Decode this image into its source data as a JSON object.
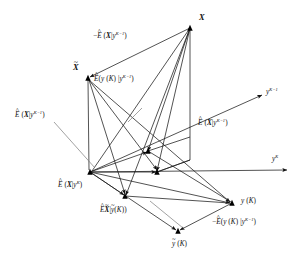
{
  "figure": {
    "kind": "vector-space-geometry-diagram",
    "background_color": "#ffffff",
    "line_color": "#1a1a1a",
    "node_color": "#000000",
    "guide_color": "#7a7a7a",
    "width": 300,
    "height": 262
  },
  "axes": [
    {
      "id": "y-K-minus-1",
      "name": "y-superscript-K-minus-1-axis",
      "label_main": "y",
      "label_sup": "K−1",
      "from": [
        90,
        172
      ],
      "to": [
        262,
        95
      ],
      "label_pos": [
        266,
        89
      ]
    },
    {
      "id": "y-K",
      "name": "y-superscript-K-axis",
      "label_main": "y",
      "label_sup": "K",
      "from": [
        90,
        172
      ],
      "to": [
        287,
        170
      ],
      "label_pos": [
        272,
        156
      ]
    }
  ],
  "nodes": [
    {
      "id": "X",
      "name": "node-X",
      "pos": [
        190,
        28
      ],
      "marker": "filled-triangle"
    },
    {
      "id": "Xtilde",
      "name": "node-X-tilde",
      "pos": [
        88,
        78
      ],
      "marker": "filled-triangle"
    },
    {
      "id": "origin",
      "name": "node-origin-Ehat-X-given-yK",
      "pos": [
        90,
        172
      ],
      "marker": "filled-triangle"
    },
    {
      "id": "mid",
      "name": "node-mid-projection",
      "pos": [
        157,
        172
      ],
      "marker": "filled-triangle"
    },
    {
      "id": "yK",
      "name": "node-y-K",
      "pos": [
        232,
        203
      ],
      "marker": "filled-triangle"
    },
    {
      "id": "ytilde",
      "name": "node-y-tilde-K",
      "pos": [
        178,
        231
      ],
      "marker": "filled-triangle"
    },
    {
      "id": "low",
      "name": "node-Ehat-Xtilde-given-ytilde",
      "pos": [
        125,
        196
      ],
      "marker": "filled-triangle"
    },
    {
      "id": "upmid",
      "name": "node-upper-mid",
      "pos": [
        148,
        151
      ],
      "marker": "filled-triangle"
    }
  ],
  "labels": [
    {
      "id": "X",
      "name": "label-X",
      "pos": [
        199,
        14
      ],
      "size": "big",
      "parts": [
        {
          "t": "X",
          "style": "bi"
        }
      ]
    },
    {
      "id": "Xtilde",
      "name": "label-X-tilde",
      "pos": [
        73,
        64
      ],
      "size": "big",
      "parts": [
        {
          "t": "X",
          "style": "bi",
          "over": "tilde"
        }
      ]
    },
    {
      "id": "negEhatX",
      "name": "label-minus-Ehat-X-given-y-K-minus-1",
      "pos": [
        93,
        33
      ],
      "size": "normal",
      "parts": [
        {
          "t": "−",
          "style": "plain"
        },
        {
          "t": "E",
          "style": "it",
          "over": "hat"
        },
        {
          "t": " (",
          "style": "plain"
        },
        {
          "t": "X",
          "style": "bi"
        },
        {
          "t": "|",
          "style": "plain"
        },
        {
          "t": "y",
          "style": "it",
          "sup": "K−1"
        },
        {
          "t": ")",
          "style": "plain"
        }
      ]
    },
    {
      "id": "EhatyK",
      "name": "label-Ehat-y-K-given-y-K-minus-1",
      "pos": [
        94,
        76
      ],
      "size": "normal",
      "parts": [
        {
          "t": "E",
          "style": "it",
          "over": "hat"
        },
        {
          "t": "(",
          "style": "plain"
        },
        {
          "t": "y",
          "style": "it"
        },
        {
          "t": " (",
          "style": "plain"
        },
        {
          "t": "K",
          "style": "it"
        },
        {
          "t": ") |",
          "style": "plain"
        },
        {
          "t": "y",
          "style": "it",
          "sup": "K−1"
        },
        {
          "t": ")",
          "style": "plain"
        }
      ]
    },
    {
      "id": "EhatXleft",
      "name": "label-Ehat-X-given-y-K-minus-1-left",
      "pos": [
        15,
        112
      ],
      "size": "normal",
      "parts": [
        {
          "t": "E",
          "style": "it",
          "over": "hat"
        },
        {
          "t": " (",
          "style": "plain"
        },
        {
          "t": "X",
          "style": "bi"
        },
        {
          "t": "|",
          "style": "plain"
        },
        {
          "t": "y",
          "style": "it",
          "sup": "K−1"
        },
        {
          "t": ")",
          "style": "plain"
        }
      ]
    },
    {
      "id": "EhatXright",
      "name": "label-Ehat-X-given-y-K-minus-1-right",
      "pos": [
        198,
        120
      ],
      "size": "normal",
      "parts": [
        {
          "t": "E",
          "style": "it",
          "over": "hat"
        },
        {
          "t": " (",
          "style": "plain"
        },
        {
          "t": "X",
          "style": "bi"
        },
        {
          "t": "|",
          "style": "plain"
        },
        {
          "t": "y",
          "style": "it",
          "sup": "K−1"
        },
        {
          "t": ")",
          "style": "plain"
        }
      ]
    },
    {
      "id": "EhatXyK",
      "name": "label-Ehat-X-given-y-K",
      "pos": [
        58,
        182
      ],
      "size": "normal",
      "parts": [
        {
          "t": "E",
          "style": "it",
          "over": "hat"
        },
        {
          "t": " (",
          "style": "plain"
        },
        {
          "t": "X",
          "style": "bi"
        },
        {
          "t": "|",
          "style": "plain"
        },
        {
          "t": "y",
          "style": "it",
          "sup": "K"
        },
        {
          "t": ")",
          "style": "plain"
        }
      ]
    },
    {
      "id": "EhatXtilde",
      "name": "label-Ehat-X-tilde-given-y-tilde-K",
      "pos": [
        100,
        207
      ],
      "size": "normal",
      "parts": [
        {
          "t": "E",
          "style": "it",
          "over": "hat"
        },
        {
          "t": "X",
          "style": "bi",
          "over": "tilde"
        },
        {
          "t": "|",
          "style": "plain"
        },
        {
          "t": "y",
          "style": "it",
          "over": "tilde"
        },
        {
          "t": "(",
          "style": "plain"
        },
        {
          "t": "K",
          "style": "it"
        },
        {
          "t": "))",
          "style": "plain"
        }
      ]
    },
    {
      "id": "yK",
      "name": "label-y-K-point",
      "pos": [
        241,
        198
      ],
      "size": "normal",
      "parts": [
        {
          "t": "y",
          "style": "it"
        },
        {
          "t": " (",
          "style": "plain"
        },
        {
          "t": "K",
          "style": "it"
        },
        {
          "t": ")",
          "style": "plain"
        }
      ]
    },
    {
      "id": "negEhatyK",
      "name": "label-minus-Ehat-y-K-given-y-K-minus-1",
      "pos": [
        212,
        219
      ],
      "size": "normal",
      "parts": [
        {
          "t": "−",
          "style": "plain"
        },
        {
          "t": "E",
          "style": "it",
          "over": "hat"
        },
        {
          "t": "(",
          "style": "plain"
        },
        {
          "t": "y",
          "style": "it"
        },
        {
          "t": " (",
          "style": "plain"
        },
        {
          "t": "K",
          "style": "it"
        },
        {
          "t": ") |",
          "style": "plain"
        },
        {
          "t": "y",
          "style": "it",
          "sup": "K−1"
        },
        {
          "t": ")",
          "style": "plain"
        }
      ]
    },
    {
      "id": "ytilde",
      "name": "label-y-tilde-K",
      "pos": [
        172,
        241
      ],
      "size": "normal",
      "parts": [
        {
          "t": "y",
          "style": "it",
          "over": "tilde"
        },
        {
          "t": " (",
          "style": "plain"
        },
        {
          "t": "K",
          "style": "it"
        },
        {
          "t": ")",
          "style": "plain"
        }
      ]
    }
  ],
  "edges": [
    {
      "name": "edge-X-to-Xtilde",
      "from": [
        190,
        28
      ],
      "to": [
        90,
        77
      ],
      "arrow": "end"
    },
    {
      "name": "edge-X-to-origin",
      "from": [
        190,
        28
      ],
      "to": [
        92,
        171
      ],
      "arrow": "none"
    },
    {
      "name": "edge-X-to-mid",
      "from": [
        190,
        28
      ],
      "to": [
        157,
        171
      ],
      "arrow": "end"
    },
    {
      "name": "edge-X-to-low",
      "from": [
        190,
        28
      ],
      "to": [
        126,
        195
      ],
      "arrow": "end"
    },
    {
      "name": "edge-X-to-upmid",
      "from": [
        190,
        28
      ],
      "to": [
        148,
        151
      ],
      "arrow": "end"
    },
    {
      "name": "edge-X-vertical-down",
      "from": [
        190,
        30
      ],
      "to": [
        190,
        160
      ],
      "arrow": "none"
    },
    {
      "name": "edge-Xtilde-down",
      "from": [
        88,
        80
      ],
      "to": [
        89,
        170
      ],
      "arrow": "none"
    },
    {
      "name": "edge-Xtilde-to-mid",
      "from": [
        89,
        80
      ],
      "to": [
        157,
        170
      ],
      "arrow": "end"
    },
    {
      "name": "edge-Xtilde-to-yK",
      "from": [
        89,
        80
      ],
      "to": [
        230,
        202
      ],
      "arrow": "end"
    },
    {
      "name": "edge-Xtilde-to-low",
      "from": [
        89,
        80
      ],
      "to": [
        125,
        194
      ],
      "arrow": "end"
    },
    {
      "name": "edge-origin-to-mid",
      "from": [
        90,
        172
      ],
      "to": [
        156,
        172
      ],
      "arrow": "end"
    },
    {
      "name": "edge-origin-to-low",
      "from": [
        90,
        172
      ],
      "to": [
        124,
        195
      ],
      "arrow": "end"
    },
    {
      "name": "edge-origin-to-upmid",
      "from": [
        90,
        172
      ],
      "to": [
        147,
        152
      ],
      "arrow": "end"
    },
    {
      "name": "edge-origin-to-yK",
      "from": [
        90,
        172
      ],
      "to": [
        230,
        203
      ],
      "arrow": "end"
    },
    {
      "name": "edge-origin-to-ytilde",
      "from": [
        90,
        172
      ],
      "to": [
        176,
        230
      ],
      "arrow": "end"
    },
    {
      "name": "edge-mid-to-upmid",
      "from": [
        157,
        172
      ],
      "to": [
        190,
        160
      ],
      "arrow": "none"
    },
    {
      "name": "edge-upmid-to-X",
      "from": [
        148,
        151
      ],
      "to": [
        190,
        137
      ],
      "arrow": "none"
    },
    {
      "name": "edge-mid-vertical",
      "from": [
        157,
        172
      ],
      "to": [
        190,
        160
      ],
      "arrow": "none"
    },
    {
      "name": "edge-yK-to-ytilde",
      "from": [
        232,
        203
      ],
      "to": [
        180,
        230
      ],
      "arrow": "end"
    },
    {
      "name": "edge-low-to-yK",
      "from": [
        125,
        196
      ],
      "to": [
        230,
        203
      ],
      "arrow": "none"
    },
    {
      "name": "edge-upmid-to-yK",
      "from": [
        148,
        151
      ],
      "to": [
        231,
        202
      ],
      "arrow": "none"
    }
  ],
  "guides": [
    {
      "name": "guide-leader-left-label",
      "from": [
        54,
        122
      ],
      "to": [
        95,
        168
      ]
    },
    {
      "name": "guide-tick-crossmark",
      "from": [
        128,
        122
      ],
      "to": [
        142,
        108
      ]
    },
    {
      "name": "guide-leader-lower",
      "from": [
        150,
        201
      ],
      "to": [
        183,
        228
      ]
    }
  ]
}
